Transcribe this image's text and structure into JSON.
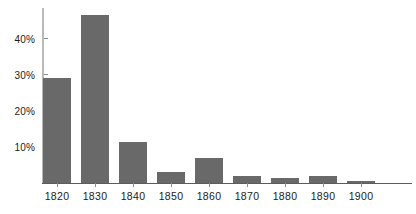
{
  "chart_data": {
    "type": "bar",
    "title": "",
    "subtitle": "",
    "xlabel": "",
    "ylabel": "",
    "categories": [
      "1820",
      "1830",
      "1840",
      "1850",
      "1860",
      "1870",
      "1880",
      "1890",
      "1900"
    ],
    "values": [
      29,
      46.5,
      11.5,
      3,
      7,
      2,
      1.5,
      2,
      0.5
    ],
    "ylim": [
      0,
      48.5
    ],
    "ytick_values": [
      10,
      20,
      30,
      40
    ],
    "ytick_labels": [
      "10%",
      "20%",
      "30%",
      "40%"
    ],
    "grid": false,
    "legend": null,
    "legend_position": "none",
    "bar_color": "#696969",
    "axis_color": "#5c5c5c",
    "tick_color": "#8a8a8a",
    "y_axis_line_color": "#b9b9b9",
    "background_color": "#ffffff",
    "text_color": "#1a1a1a"
  }
}
